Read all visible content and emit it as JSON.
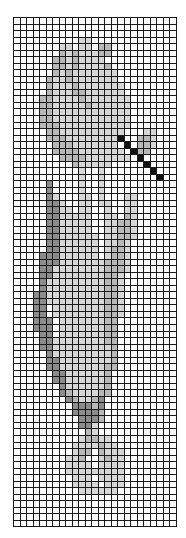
{
  "pattern": {
    "title": "Cross-stitch chart: tulip with needle",
    "columns": 25,
    "rows_count": 78,
    "palette": {
      ".": "#ffffff",
      "l": "#d6d6d6",
      "m": "#b8b8b8",
      "d": "#8c8c8c",
      "k": "#111111"
    },
    "rows": [
      ".........................",
      ".........................",
      ".........................",
      "..........ll.............",
      ".......ll.ll.mm..........",
      ".......mlmlllmm..........",
      "......mmlmllll...........",
      "......mmlmllllm..........",
      "......mlmlllllll.........",
      ".....mllmlllllll.........",
      ".....mlllmlllllll........",
      ".....mlllmmllllll........",
      "....mmllllmlllllll.......",
      "....mmlllllmllllll.......",
      "....mmllllllllllll.......",
      "....mmllllllllllll.......",
      "....mmmlllllllllll.......",
      ".....mmllllllllll...ll...",
      ".....mmmllllllllk..mml...",
      "......mmmlllllll.k.mml...",
      "......mmmmlllllll.kmm....",
      ".......mmmmlllllll.k.....",
      ".........mlllll.....k....",
      "..........l..l.......k...",
      "..........l..l........k..",
      ".....d....l..l...........",
      ".....d....l..l...........",
      ".....dl...ll.l...ll......",
      ".....ddl..ll.ll..ll......",
      ".....ddll.ll..l..ll......",
      ".....ddlllll..ll.ml......",
      ".....ddlllll..llmml......",
      ".....ddlllll..llmml......",
      ".....ddllllll.llmml......",
      ".....ddllllll.llml.......",
      ".....ddllllll.lmml.......",
      "....dddllllll.lmml.......",
      "....dddlllllllmmml.......",
      "....ddllllllllmmml.......",
      "....ddllllllllmml........",
      "....dlllllllllmml........",
      "....dlllllllllmml........",
      "...ddlllllllllmml........",
      "...ddlllllllllmml........",
      "...dd.llllllllmml........",
      "...dd.llllllllmml........",
      "...ddd.lllllllmm.........",
      "...ddd.lllllllmm.........",
      "....dd.lllllllmm.........",
      "....ddllllllllmm.........",
      "....ddlllllllllm.........",
      ".....dlllllllllm.........",
      ".....ddllllllllm.........",
      ".....ddlllllllmm.........",
      "......ddllllllm..........",
      "......ddllllllm..........",
      ".......dllllllm..........",
      ".......dmllllmm..........",
      "........dmllmd...........",
      ".........dddmd...........",
      ".........ddddm...........",
      "..........dddm...........",
      "..........ddl............",
      "...........ml............",
      "..........lmmll..........",
      ".........llllmll.........",
      ".........lmm.mlll........",
      "........llm..lmll........",
      "........llll.llll........",
      "........lllllllll........",
      ".........lll.llll........",
      ".........llll.lll........",
      "..........llllll.........",
      ".........................",
      ".........................",
      ".........................",
      ".........................",
      "........................."
    ]
  }
}
